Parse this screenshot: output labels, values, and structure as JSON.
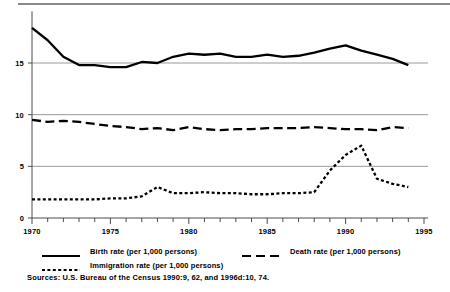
{
  "figure": {
    "sources_note": "Sources: U.S. Bureau of the Census 1990:9, 62, and 1996d:10, 74."
  },
  "legend": {
    "items": [
      {
        "key": "solid-line-key",
        "label": "Birth rate  (per 1,000 persons)"
      },
      {
        "key": "dashed-line-key",
        "label": "Death rate (per 1,000 persons)"
      },
      {
        "key": "dotted-line-key",
        "label": "Immigration rate (per 1,000 persons)"
      }
    ]
  },
  "chart_data": {
    "type": "line",
    "title": "",
    "subtitle": "",
    "xlabel": "",
    "ylabel": "",
    "xlim": [
      1970,
      1995
    ],
    "ylim": [
      0,
      20
    ],
    "yticks": [
      0,
      5,
      10,
      15
    ],
    "ytick_labels": [
      "0",
      "5",
      "10",
      "15"
    ],
    "xticks": [
      1970,
      1975,
      1980,
      1985,
      1990,
      1995
    ],
    "xtick_labels": [
      "1970",
      "1975",
      "1980",
      "1985",
      "1990",
      "1995"
    ],
    "minor_xticks_every": 1,
    "grid": "horizontal",
    "legend_position": "below",
    "x": [
      1970,
      1971,
      1972,
      1973,
      1974,
      1975,
      1976,
      1977,
      1978,
      1979,
      1980,
      1981,
      1982,
      1983,
      1984,
      1985,
      1986,
      1987,
      1988,
      1989,
      1990,
      1991,
      1992,
      1993,
      1994
    ],
    "series": [
      {
        "name": "Birth rate  (per 1,000 persons)",
        "style": "solid",
        "values": [
          18.4,
          17.2,
          15.6,
          14.8,
          14.8,
          14.6,
          14.6,
          15.1,
          15.0,
          15.6,
          15.9,
          15.8,
          15.9,
          15.6,
          15.6,
          15.8,
          15.6,
          15.7,
          16.0,
          16.4,
          16.7,
          16.2,
          15.8,
          15.4,
          14.8
        ]
      },
      {
        "name": "Death rate (per 1,000 persons)",
        "style": "dashed",
        "values": [
          9.5,
          9.3,
          9.4,
          9.3,
          9.1,
          8.9,
          8.8,
          8.6,
          8.7,
          8.5,
          8.8,
          8.6,
          8.5,
          8.6,
          8.6,
          8.7,
          8.7,
          8.7,
          8.8,
          8.7,
          8.6,
          8.6,
          8.5,
          8.8,
          8.7
        ]
      },
      {
        "name": "Immigration rate (per 1,000 persons)",
        "style": "dotted",
        "values": [
          1.8,
          1.8,
          1.8,
          1.8,
          1.8,
          1.9,
          1.9,
          2.1,
          3.0,
          2.4,
          2.4,
          2.5,
          2.4,
          2.4,
          2.3,
          2.3,
          2.4,
          2.4,
          2.5,
          4.6,
          6.1,
          7.0,
          3.8,
          3.3,
          3.0
        ]
      }
    ]
  }
}
